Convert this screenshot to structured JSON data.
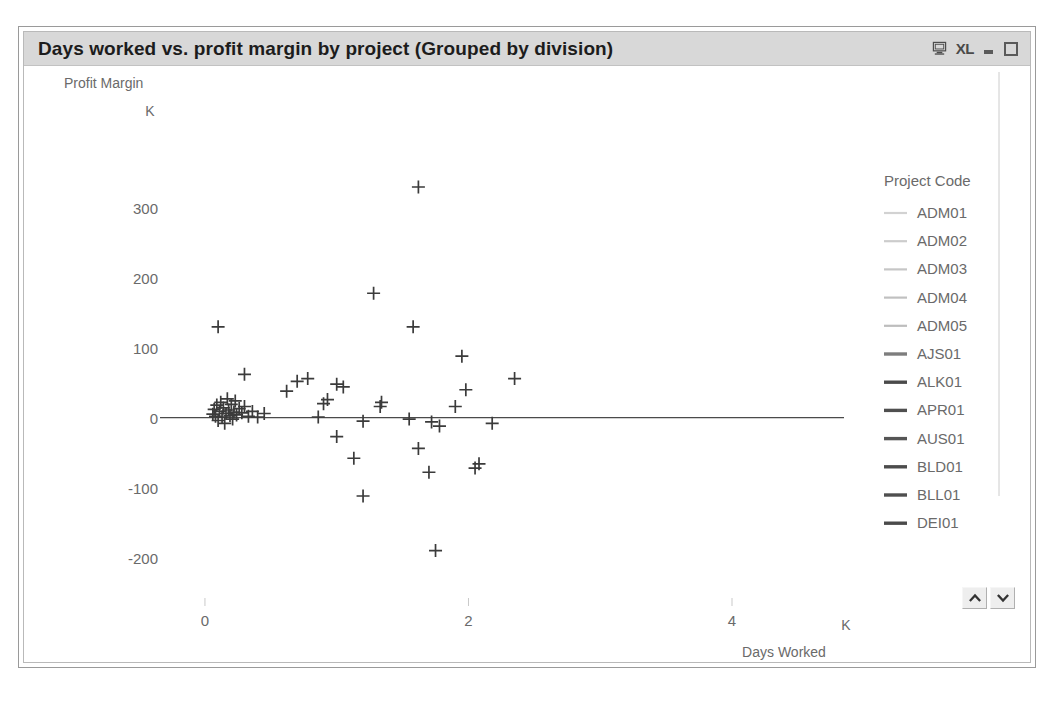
{
  "window": {
    "title": "Days worked vs. profit margin by project (Grouped by division)",
    "controls": {
      "monitor_label": "monitor-icon",
      "xl_label": "XL",
      "minimize_label": "_",
      "maximize_label": "maximize"
    }
  },
  "colors": {
    "titlebar_bg": "#d8d8d8",
    "title_text": "#1c1c1c",
    "axis_text": "#6a6a6a",
    "marker": "#3b3b3b",
    "axis_line": "#4a4a4a",
    "legend_light": "#cfcfcf",
    "legend_dark": "#5a5a5a",
    "frame": "#9a9a9a"
  },
  "chart_data": {
    "type": "scatter",
    "title": "Days worked vs. profit margin by project (Grouped by division)",
    "xlabel": "Days Worked",
    "ylabel": "Profit Margin",
    "x_unit": "K",
    "y_unit": "K",
    "xlim": [
      -0.25,
      4.85
    ],
    "ylim": [
      -255,
      360
    ],
    "xticks": [
      0,
      2,
      4
    ],
    "xtick_labels": [
      "0",
      "2",
      "4"
    ],
    "yticks": [
      300,
      200,
      100,
      0,
      -100,
      -200
    ],
    "ytick_labels": [
      "300",
      "200",
      "100",
      "0",
      "-100",
      "-200"
    ],
    "grid": false,
    "marker": "+",
    "zero_line": true,
    "legend_position": "right",
    "legend_title": "Project Code",
    "points": [
      [
        0.06,
        5
      ],
      [
        0.07,
        12
      ],
      [
        0.08,
        2
      ],
      [
        0.09,
        18
      ],
      [
        0.1,
        -4
      ],
      [
        0.11,
        9
      ],
      [
        0.12,
        22
      ],
      [
        0.13,
        1
      ],
      [
        0.14,
        14
      ],
      [
        0.15,
        -8
      ],
      [
        0.16,
        6
      ],
      [
        0.17,
        27
      ],
      [
        0.18,
        11
      ],
      [
        0.19,
        3
      ],
      [
        0.2,
        19
      ],
      [
        0.21,
        -2
      ],
      [
        0.22,
        8
      ],
      [
        0.23,
        24
      ],
      [
        0.24,
        4
      ],
      [
        0.26,
        13
      ],
      [
        0.28,
        7
      ],
      [
        0.3,
        16
      ],
      [
        0.33,
        2
      ],
      [
        0.36,
        9
      ],
      [
        0.4,
        1
      ],
      [
        0.1,
        130
      ],
      [
        0.3,
        62
      ],
      [
        0.45,
        6
      ],
      [
        0.62,
        38
      ],
      [
        0.7,
        52
      ],
      [
        0.78,
        56
      ],
      [
        0.9,
        20
      ],
      [
        0.93,
        26
      ],
      [
        1.0,
        48
      ],
      [
        1.05,
        44
      ],
      [
        0.86,
        1
      ],
      [
        1.0,
        -27
      ],
      [
        1.13,
        -58
      ],
      [
        1.2,
        -112
      ],
      [
        1.28,
        178
      ],
      [
        1.33,
        16
      ],
      [
        1.34,
        22
      ],
      [
        1.2,
        -5
      ],
      [
        1.55,
        -2
      ],
      [
        1.58,
        130
      ],
      [
        1.62,
        -44
      ],
      [
        1.7,
        -78
      ],
      [
        1.75,
        -190
      ],
      [
        1.72,
        -6
      ],
      [
        1.78,
        -12
      ],
      [
        1.9,
        16
      ],
      [
        1.95,
        88
      ],
      [
        1.98,
        40
      ],
      [
        2.05,
        -72
      ],
      [
        2.08,
        -66
      ],
      [
        2.18,
        -8
      ],
      [
        2.35,
        56
      ],
      [
        1.62,
        330
      ]
    ],
    "series_labels": [
      "ADM01",
      "ADM02",
      "ADM03",
      "ADM04",
      "ADM05",
      "AJS01",
      "ALK01",
      "APR01",
      "AUS01",
      "BLD01",
      "BLL01",
      "DEI01"
    ]
  },
  "legend": {
    "title": "Project Code",
    "items": [
      {
        "label": "ADM01",
        "color": "#d2d2d2"
      },
      {
        "label": "ADM02",
        "color": "#cccccc"
      },
      {
        "label": "ADM03",
        "color": "#c6c6c6"
      },
      {
        "label": "ADM04",
        "color": "#c0c0c0"
      },
      {
        "label": "ADM05",
        "color": "#bdbdbd"
      },
      {
        "label": "AJS01",
        "color": "#7d7d7d"
      },
      {
        "label": "ALK01",
        "color": "#4a4a4a"
      },
      {
        "label": "APR01",
        "color": "#4f4f4f"
      },
      {
        "label": "AUS01",
        "color": "#555555"
      },
      {
        "label": "BLD01",
        "color": "#4c4c4c"
      },
      {
        "label": "BLL01",
        "color": "#4f4f4f"
      },
      {
        "label": "DEI01",
        "color": "#4a4a4a"
      }
    ],
    "scroll_up_label": "scroll up",
    "scroll_down_label": "scroll down"
  }
}
